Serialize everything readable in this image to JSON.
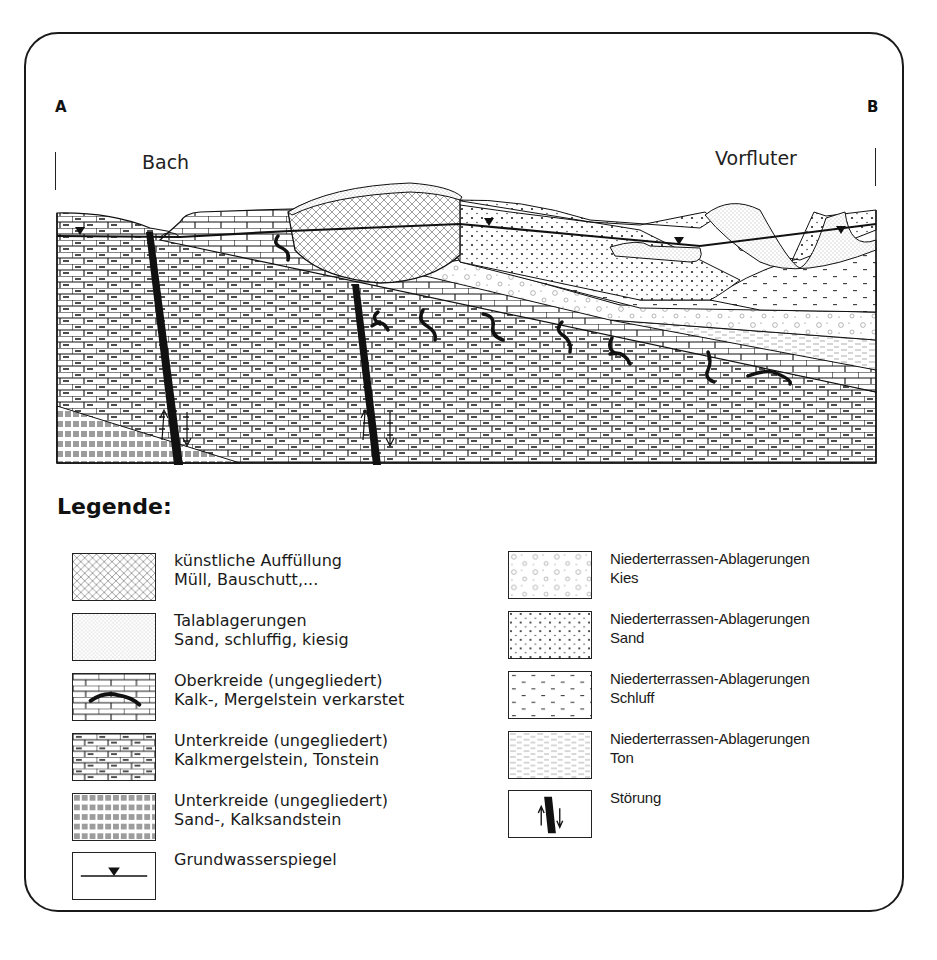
{
  "section": {
    "endpoint_left": "A",
    "endpoint_right": "B",
    "place_left": "Bach",
    "place_right": "Vorfluter",
    "colors": {
      "line": "#111111",
      "background": "#ffffff"
    }
  },
  "legend": {
    "title": "Legende:",
    "left_column": [
      {
        "pattern": "crosshatch",
        "line1": "künstliche Auffüllung",
        "line2": "Müll, Bauschutt,..."
      },
      {
        "pattern": "fine-dots",
        "line1": "Talablagerungen",
        "line2": "Sand, schluffig, kiesig"
      },
      {
        "pattern": "brick-karst",
        "line1": "Oberkreide (ungegliedert)",
        "line2": "Kalk-, Mergelstein  verkarstet"
      },
      {
        "pattern": "brick-dash",
        "line1": "Unterkreide (ungegliedert)",
        "line2": "Kalkmergelstein, Tonstein"
      },
      {
        "pattern": "basket-weave",
        "line1": "Unterkreide (ungegliedert)",
        "line2": "Sand-, Kalksandstein"
      },
      {
        "pattern": "water-table",
        "line1": "Grundwasserspiegel",
        "line2": ""
      }
    ],
    "right_column": [
      {
        "pattern": "circles",
        "line1": "Niederterrassen-Ablagerungen",
        "line2": "Kies"
      },
      {
        "pattern": "dots",
        "line1": "Niederterrassen-Ablagerungen",
        "line2": "Sand"
      },
      {
        "pattern": "silt",
        "line1": "Niederterrassen-Ablagerungen",
        "line2": "Schluff"
      },
      {
        "pattern": "dashes",
        "line1": "Niederterrassen-Ablagerungen",
        "line2": "Ton"
      },
      {
        "pattern": "fault",
        "line1": "Störung",
        "line2": ""
      }
    ]
  }
}
